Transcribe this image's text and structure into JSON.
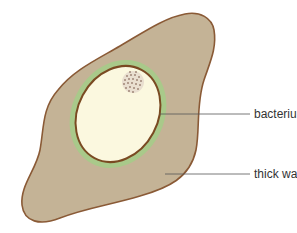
{
  "diagram": {
    "labels": [
      {
        "id": "bacterium",
        "text": "bacterium"
      },
      {
        "id": "thick-wall",
        "text": "thick wall"
      }
    ],
    "colors": {
      "outer_wall_fill": "#c4b396",
      "outer_wall_stroke": "#8a5a36",
      "green_layer": "#a9c98a",
      "inner_membrane": "#7a4a22",
      "cytoplasm": "#fbf8df",
      "nucleoid_dots": "#6b4a3a",
      "leader_line": "#555555"
    }
  }
}
